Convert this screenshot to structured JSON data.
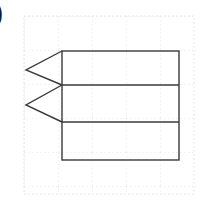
{
  "figure": {
    "label": ")",
    "label_name": "item-marker",
    "background_color": "#ffffff",
    "stroke_color": "#3a3a3a",
    "grid_color": "#e2e2e8",
    "stroke_width": 1.4,
    "grid": {
      "visible": true,
      "style": "dotted",
      "x_start": 24,
      "x_end": 194,
      "y_start": 16,
      "y_end": 194,
      "cell_size": 34,
      "vertical_lines": [
        24,
        58,
        92,
        126,
        160,
        194
      ],
      "horizontal_lines": [
        16,
        50,
        84,
        118,
        152,
        186
      ]
    },
    "shapes": [
      {
        "name": "main-rectangle",
        "type": "rect",
        "x": 62,
        "y": 51,
        "width": 117,
        "height": 109,
        "fill": "none"
      },
      {
        "name": "divider-line-upper",
        "type": "line",
        "x1": 62,
        "y1": 85,
        "x2": 179,
        "y2": 85
      },
      {
        "name": "divider-line-lower",
        "type": "line",
        "x1": 62,
        "y1": 122,
        "x2": 179,
        "y2": 122
      },
      {
        "name": "chevron-upper",
        "type": "polyline",
        "points": "62,51 26,70 62,85"
      },
      {
        "name": "chevron-lower",
        "type": "polyline",
        "points": "62,85 26,105 62,122"
      }
    ],
    "band_count": 3,
    "chevron_count": 2
  }
}
